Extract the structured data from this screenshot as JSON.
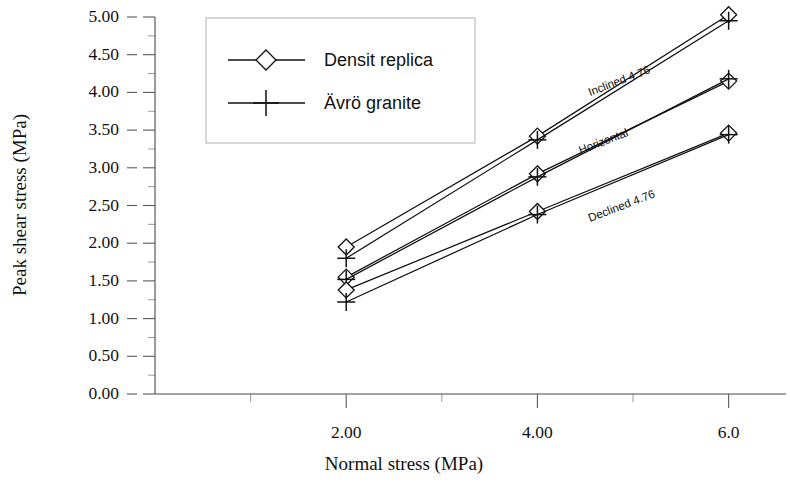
{
  "chart_data": {
    "type": "line",
    "title": "",
    "xlabel": "Normal stress (MPa)",
    "ylabel": "Peak shear stress  (MPa)",
    "xlim": [
      0.0,
      6.6
    ],
    "ylim": [
      0.0,
      5.0
    ],
    "grid": false,
    "x_ticks": [
      2.0,
      4.0,
      6.0
    ],
    "x_tick_labels": [
      "2.00",
      "4.00",
      "6.0"
    ],
    "x_minor_tick_step": 1.0,
    "y_ticks": [
      0.0,
      0.5,
      1.0,
      1.5,
      2.0,
      2.5,
      3.0,
      3.5,
      4.0,
      4.5,
      5.0
    ],
    "y_tick_labels": [
      "0.00",
      "0.50",
      "1.00",
      "1.50",
      "2.00",
      "2.50",
      "3.00",
      "3.50",
      "4.00",
      "4.50",
      "5.00"
    ],
    "y_minor_tick_step": 0.25,
    "x": [
      2.0,
      4.0,
      6.0
    ],
    "legend_position": "upper-left-inset",
    "legend": [
      "Densit replica",
      "Ävrö granite"
    ],
    "annotations": [
      {
        "text": "Inclined 4.76",
        "x": 4.55,
        "y": 3.95,
        "rotation": -21
      },
      {
        "text": "Horizontal",
        "x": 4.45,
        "y": 3.18,
        "rotation": -21
      },
      {
        "text": "Declined 4.76",
        "x": 4.55,
        "y": 2.28,
        "rotation": -21
      }
    ],
    "groups": [
      {
        "name": "Inclined 4.76",
        "series": [
          {
            "name": "Densit replica",
            "marker": "diamond",
            "values": [
              1.95,
              3.42,
              5.03
            ]
          },
          {
            "name": "Ävrö granite",
            "marker": "plus",
            "values": [
              1.8,
              3.37,
              4.95
            ]
          }
        ]
      },
      {
        "name": "Horizontal",
        "series": [
          {
            "name": "Densit replica",
            "marker": "diamond",
            "values": [
              1.55,
              2.92,
              4.15
            ]
          },
          {
            "name": "Ävrö granite",
            "marker": "plus",
            "values": [
              1.52,
              2.88,
              4.18
            ]
          }
        ]
      },
      {
        "name": "Declined 4.76",
        "series": [
          {
            "name": "Densit replica",
            "marker": "diamond",
            "values": [
              1.38,
              2.42,
              3.46
            ]
          },
          {
            "name": "Ävrö granite",
            "marker": "plus",
            "values": [
              1.22,
              2.38,
              3.44
            ]
          }
        ]
      }
    ]
  },
  "legend": {
    "items": [
      {
        "label": "Densit replica",
        "marker": "diamond"
      },
      {
        "label": "Ävrö granite",
        "marker": "plus"
      }
    ]
  },
  "axes": {
    "x_title": "Normal stress (MPa)",
    "y_title": "Peak shear stress  (MPa)"
  },
  "annotation_labels": {
    "inclined": "Inclined 4.76",
    "horizontal": "Horizontal",
    "declined": "Declined 4.76"
  },
  "colors": {
    "ink": "#111111",
    "axis": "#4a4a4a",
    "legend_border": "#b9b9b9",
    "background": "#ffffff"
  }
}
